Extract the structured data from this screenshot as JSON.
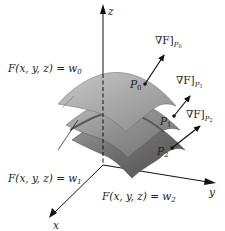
{
  "figure": {
    "axes": {
      "z_label": "z",
      "y_label": "y",
      "x_label": "x"
    },
    "surfaces": [
      {
        "label_prefix": "F(x, y, z) = w",
        "subscript": "0",
        "color": "#a9a9a9"
      },
      {
        "label_prefix": "F(x, y, z) = w",
        "subscript": "1",
        "color": "#8e8e8e"
      },
      {
        "label_prefix": "F(x, y, z) = w",
        "subscript": "2",
        "color": "#6a6a6a"
      }
    ],
    "points": [
      {
        "name": "P",
        "subscript": "0",
        "gradient_label": "∇F]",
        "gradient_sub": "P",
        "gradient_sub_idx": "0"
      },
      {
        "name": "P",
        "subscript": "1",
        "gradient_label": "∇F]",
        "gradient_sub": "P",
        "gradient_sub_idx": "1"
      },
      {
        "name": "P",
        "subscript": "2",
        "gradient_label": "∇F]",
        "gradient_sub": "P",
        "gradient_sub_idx": "2"
      }
    ]
  }
}
